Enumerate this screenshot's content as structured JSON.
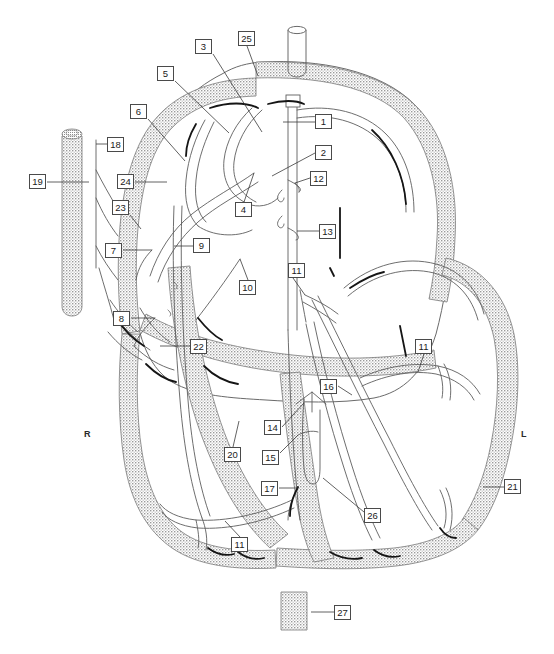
{
  "figure": {
    "kind": "anatomical-line-diagram",
    "background_color": "#ffffff",
    "line_color": "#555555",
    "accent_line_color": "#111111",
    "stipple_fill_color": "#b9b9b9",
    "label_box_border_color": "#4a4a4a",
    "label_text_color": "#1a1a1a"
  },
  "side_markers": [
    {
      "name": "right-side-marker",
      "label": "R",
      "x": 84,
      "y": 429
    },
    {
      "name": "left-side-marker",
      "label": "L",
      "x": 521,
      "y": 429
    }
  ],
  "callouts": [
    {
      "id": 1,
      "label": "1",
      "box_x": 315,
      "box_y": 114,
      "leader": [
        [
          315,
          122
        ],
        [
          283,
          122
        ]
      ]
    },
    {
      "id": 2,
      "label": "2",
      "box_x": 315,
      "box_y": 145,
      "leader": [
        [
          315,
          153
        ],
        [
          272,
          176
        ]
      ]
    },
    {
      "id": 3,
      "label": "3",
      "box_x": 195,
      "box_y": 39,
      "leader": [
        [
          213,
          54
        ],
        [
          262,
          132
        ]
      ]
    },
    {
      "id": 4,
      "label": "4",
      "box_x": 235,
      "box_y": 202,
      "leader": [
        [
          244,
          202
        ],
        [
          254,
          173
        ]
      ]
    },
    {
      "id": 5,
      "label": "5",
      "box_x": 157,
      "box_y": 66,
      "leader": [
        [
          175,
          81
        ],
        [
          229,
          133
        ]
      ]
    },
    {
      "id": 6,
      "label": "6",
      "box_x": 130,
      "box_y": 104,
      "leader": [
        [
          148,
          119
        ],
        [
          185,
          161
        ]
      ]
    },
    {
      "id": 7,
      "label": "7",
      "box_x": 105,
      "box_y": 243,
      "leader": [
        [
          123,
          250
        ],
        [
          152,
          250
        ]
      ]
    },
    {
      "id": 8,
      "label": "8",
      "box_x": 113,
      "box_y": 311,
      "leader": [
        [
          131,
          318
        ],
        [
          155,
          318
        ]
      ]
    },
    {
      "id": 9,
      "label": "9",
      "box_x": 193,
      "box_y": 238,
      "leader": [
        [
          193,
          246
        ],
        [
          174,
          246
        ]
      ]
    },
    {
      "id": 10,
      "label": "10",
      "box_x": 239,
      "box_y": 280,
      "leader": [
        [
          248,
          280
        ],
        [
          240,
          259
        ]
      ]
    },
    {
      "id": 11,
      "label": "11",
      "box_x": 288,
      "box_y": 263,
      "leader": [
        [
          293,
          278
        ],
        [
          305,
          295
        ]
      ],
      "variant": "multi"
    },
    {
      "id": 11,
      "label": "11",
      "box_x": 415,
      "box_y": 339,
      "leader": [
        [
          424,
          354
        ],
        [
          418,
          372
        ]
      ],
      "variant": "right"
    },
    {
      "id": 11,
      "label": "11",
      "box_x": 231,
      "box_y": 537,
      "leader": [
        [
          240,
          537
        ],
        [
          225,
          521
        ]
      ],
      "variant": "bottom"
    },
    {
      "id": 12,
      "label": "12",
      "box_x": 310,
      "box_y": 171,
      "leader": [
        [
          310,
          178
        ],
        [
          295,
          183
        ]
      ]
    },
    {
      "id": 13,
      "label": "13",
      "box_x": 319,
      "box_y": 224,
      "leader": [
        [
          319,
          231
        ],
        [
          297,
          231
        ]
      ]
    },
    {
      "id": 14,
      "label": "14",
      "box_x": 264,
      "box_y": 420,
      "leader": [
        [
          282,
          427
        ],
        [
          304,
          403
        ]
      ]
    },
    {
      "id": 15,
      "label": "15",
      "box_x": 262,
      "box_y": 450,
      "leader": [
        [
          280,
          453
        ],
        [
          298,
          435
        ]
      ]
    },
    {
      "id": 16,
      "label": "16",
      "box_x": 320,
      "box_y": 379,
      "leader": [
        [
          338,
          386
        ],
        [
          352,
          395
        ]
      ]
    },
    {
      "id": 17,
      "label": "17",
      "box_x": 261,
      "box_y": 481,
      "leader": [
        [
          279,
          488
        ],
        [
          298,
          488
        ]
      ]
    },
    {
      "id": 18,
      "label": "18",
      "box_x": 107,
      "box_y": 137,
      "leader": [
        [
          107,
          144
        ],
        [
          96,
          144
        ]
      ]
    },
    {
      "id": 19,
      "label": "19",
      "box_x": 29,
      "box_y": 174,
      "leader": [
        [
          47,
          182
        ],
        [
          89,
          182
        ]
      ]
    },
    {
      "id": 20,
      "label": "20",
      "box_x": 224,
      "box_y": 447,
      "leader": [
        [
          233,
          447
        ],
        [
          239,
          421
        ]
      ]
    },
    {
      "id": 21,
      "label": "21",
      "box_x": 504,
      "box_y": 479,
      "leader": [
        [
          504,
          487
        ],
        [
          483,
          487
        ]
      ]
    },
    {
      "id": 22,
      "label": "22",
      "box_x": 190,
      "box_y": 339,
      "leader": [
        [
          190,
          346
        ],
        [
          160,
          346
        ]
      ]
    },
    {
      "id": 23,
      "label": "23",
      "box_x": 112,
      "box_y": 200,
      "leader": [
        [
          130,
          215
        ],
        [
          141,
          229
        ]
      ]
    },
    {
      "id": 24,
      "label": "24",
      "box_x": 117,
      "box_y": 174,
      "leader": [
        [
          135,
          182
        ],
        [
          167,
          182
        ]
      ]
    },
    {
      "id": 25,
      "label": "25",
      "box_x": 238,
      "box_y": 31,
      "leader": [
        [
          247,
          46
        ],
        [
          258,
          76
        ]
      ]
    },
    {
      "id": 26,
      "label": "26",
      "box_x": 364,
      "box_y": 508,
      "leader": [
        [
          364,
          512
        ],
        [
          323,
          478
        ]
      ]
    },
    {
      "id": 27,
      "label": "27",
      "box_x": 334,
      "box_y": 605,
      "leader": [
        [
          334,
          612
        ],
        [
          311,
          612
        ]
      ]
    }
  ],
  "callout_count": 30,
  "number_range": {
    "min": 1,
    "max": 27
  }
}
